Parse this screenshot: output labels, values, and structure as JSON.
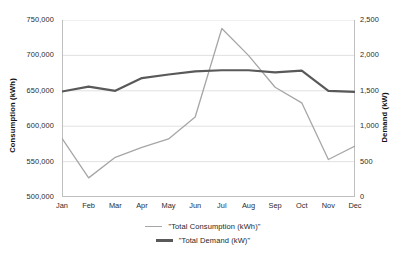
{
  "chart_data": {
    "type": "line",
    "title": "",
    "xlabel": "",
    "categories": [
      "Jan",
      "Feb",
      "Mar",
      "Apr",
      "May",
      "Jun",
      "Jul",
      "Aug",
      "Sep",
      "Oct",
      "Nov",
      "Dec"
    ],
    "grid": true,
    "legend_position": "bottom",
    "axes": {
      "left": {
        "label": "Consumption (kWh)",
        "min": 500000,
        "max": 750000,
        "step": 50000,
        "ticks": [
          "500,000",
          "550,000",
          "600,000",
          "650,000",
          "700,000",
          "750,000"
        ],
        "tick_values": [
          500000,
          550000,
          600000,
          650000,
          700000,
          750000
        ]
      },
      "right": {
        "label": "Demand (kW)",
        "min": 0,
        "max": 2500,
        "step": 500,
        "ticks": [
          "0",
          "500",
          "1,000",
          "1,500",
          "2,000",
          "2,500"
        ],
        "tick_values": [
          0,
          500,
          1000,
          1500,
          2000,
          2500
        ]
      }
    },
    "series": [
      {
        "name": "\"Total Consumption (kWh)\"",
        "axis": "left",
        "color": "#a6a6a6",
        "width": 1.3,
        "values": [
          583000,
          527000,
          556000,
          570000,
          582000,
          613000,
          738000,
          700000,
          655000,
          633000,
          553000,
          572000
        ]
      },
      {
        "name": "\"Total Demand (kW)\"",
        "axis": "right",
        "color": "#595959",
        "width": 2.2,
        "values": [
          1490,
          1560,
          1500,
          1680,
          1730,
          1775,
          1790,
          1790,
          1760,
          1785,
          1500,
          1485
        ]
      }
    ]
  },
  "legend": {
    "items": [
      {
        "label": "\"Total Consumption (kWh)\"",
        "swatch": "consumption"
      },
      {
        "label": "\"Total Demand (kW)\"",
        "swatch": "demand"
      }
    ]
  },
  "colors": {
    "consumption": "#a6a6a6",
    "demand": "#595959",
    "grid": "#d9d9d9",
    "frame": "#bfbfbf",
    "text": "#1f1f1f",
    "background": "#ffffff"
  }
}
